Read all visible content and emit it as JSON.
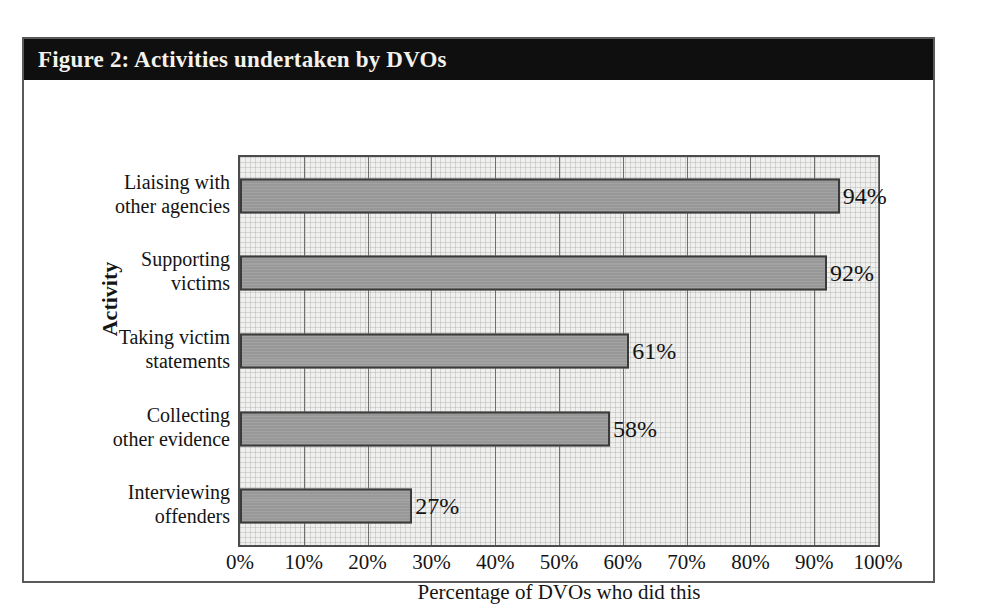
{
  "figure": {
    "title": "Figure 2: Activities undertaken by DVOs"
  },
  "chart_data": {
    "type": "bar",
    "orientation": "horizontal",
    "title": "Figure 2: Activities undertaken by DVOs",
    "xlabel": "Percentage of DVOs who did this",
    "ylabel": "Activity",
    "xlim": [
      0,
      100
    ],
    "grid": true,
    "legend": "none",
    "categories": [
      "Liaising with other agencies",
      "Supporting victims",
      "Taking victim statements",
      "Collecting other evidence",
      "Interviewing offenders"
    ],
    "category_lines": [
      [
        "Liaising with",
        "other agencies"
      ],
      [
        "Supporting",
        "victims"
      ],
      [
        "Taking victim",
        "statements"
      ],
      [
        "Collecting",
        "other evidence"
      ],
      [
        "Interviewing",
        "offenders"
      ]
    ],
    "values": [
      94,
      92,
      61,
      58,
      27
    ],
    "data_labels": [
      "94%",
      "92%",
      "61%",
      "58%",
      "27%"
    ],
    "xticks": [
      0,
      10,
      20,
      30,
      40,
      50,
      60,
      70,
      80,
      90,
      100
    ],
    "xticklabels": [
      "0%",
      "10%",
      "20%",
      "30%",
      "40%",
      "50%",
      "60%",
      "70%",
      "80%",
      "90%",
      "100%"
    ],
    "colors": {
      "bar_fill": "#989898",
      "bar_border": "#3b3b3b",
      "plot_background": "#f0f0ef",
      "gridline": "#6f6f6f",
      "title_bar_background": "#100f0f",
      "title_text": "#f4f2ee",
      "figure_border": "#5a5a5a",
      "text": "#141414"
    }
  }
}
